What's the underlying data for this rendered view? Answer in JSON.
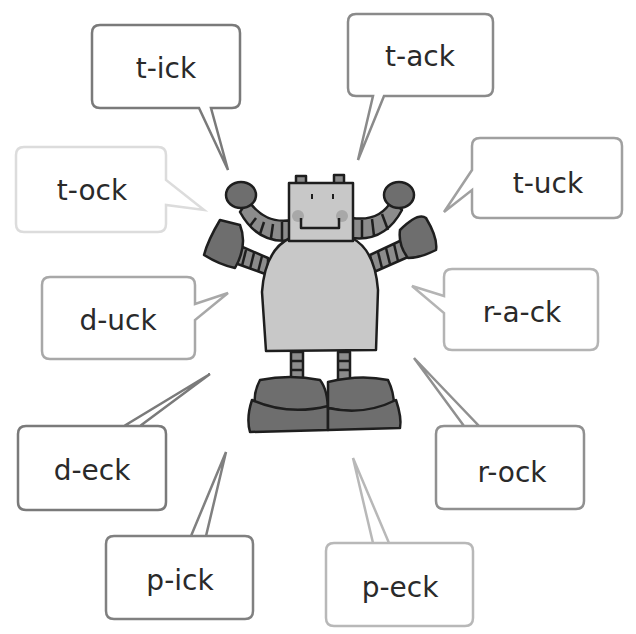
{
  "worksheet": {
    "title": "Robot word blends",
    "character": "robot"
  },
  "bubbles": [
    {
      "id": "t-ick",
      "text": "t-ick",
      "outline_color": "#7a7a7a"
    },
    {
      "id": "t-ack",
      "text": "t-ack",
      "outline_color": "#8a8a8a"
    },
    {
      "id": "t-ock",
      "text": "t-ock",
      "outline_color": "#dcdcdc"
    },
    {
      "id": "t-uck",
      "text": "t-uck",
      "outline_color": "#a0a0a0"
    },
    {
      "id": "d-uck",
      "text": "d-uck",
      "outline_color": "#a8a8a8"
    },
    {
      "id": "r-a-ck",
      "text": "r-a-ck",
      "outline_color": "#b4b4b4"
    },
    {
      "id": "d-eck",
      "text": "d-eck",
      "outline_color": "#7a7a7a"
    },
    {
      "id": "r-ock",
      "text": "r-ock",
      "outline_color": "#909090"
    },
    {
      "id": "p-ick",
      "text": "p-ick",
      "outline_color": "#808080"
    },
    {
      "id": "p-eck",
      "text": "p-eck",
      "outline_color": "#b8b8b8"
    }
  ],
  "colors": {
    "robot_light": "#c8c8c8",
    "robot_dark": "#6e6e6e",
    "robot_mid": "#8c8c8c",
    "outline": "#1e1e1e",
    "cheek": "#a8a8a8"
  }
}
